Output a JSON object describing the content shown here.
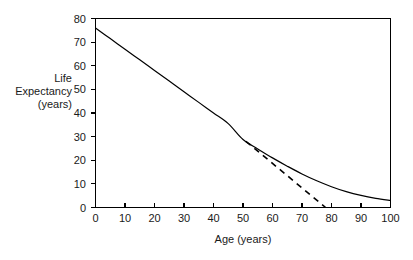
{
  "chart_data": {
    "type": "line",
    "title": "",
    "xlabel": "Age (years)",
    "ylabel": "Life Expectancy (years)",
    "ylabel_lines": [
      "Life",
      "Expectancy",
      "(years)"
    ],
    "xlim": [
      0,
      100
    ],
    "ylim": [
      0,
      80
    ],
    "xticks": [
      0,
      10,
      20,
      30,
      40,
      50,
      60,
      70,
      80,
      90,
      100
    ],
    "yticks": [
      0,
      10,
      20,
      30,
      40,
      50,
      60,
      70,
      80
    ],
    "xtick_labels": [
      "0",
      "10",
      "20",
      "30",
      "40",
      "50",
      "60",
      "70",
      "80",
      "90",
      "100"
    ],
    "ytick_labels": [
      "0",
      "10",
      "20",
      "30",
      "40",
      "50",
      "60",
      "70",
      "80"
    ],
    "grid": false,
    "legend": null,
    "legend_position": "none",
    "series": [
      {
        "name": "Life expectancy curve",
        "style": "solid",
        "color": "#000000",
        "x": [
          0,
          5,
          10,
          15,
          20,
          25,
          30,
          35,
          40,
          45,
          50,
          55,
          60,
          65,
          70,
          75,
          80,
          85,
          90,
          95,
          100
        ],
        "values": [
          76.0,
          71.5,
          67.0,
          62.5,
          58.0,
          53.5,
          49.0,
          44.5,
          40.0,
          35.5,
          28.8,
          24.8,
          21.0,
          17.5,
          14.2,
          11.3,
          8.8,
          6.7,
          5.1,
          3.9,
          3.0
        ]
      },
      {
        "name": "Tangent extrapolation",
        "style": "dashed",
        "color": "#000000",
        "x": [
          51,
          78
        ],
        "values": [
          28.0,
          0.0
        ]
      }
    ],
    "annotations": []
  },
  "axis": {
    "x_title": "Age (years)",
    "y_title_lines": [
      "Life",
      "Expectancy",
      "(years)"
    ]
  },
  "colors": {
    "background": "#ffffff",
    "ink": "#000000",
    "text": "#1a1a1a"
  }
}
